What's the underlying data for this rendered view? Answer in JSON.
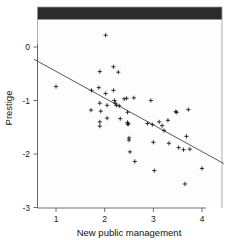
{
  "figure": {
    "kind": "scatterplot-with-regression-line",
    "background_color": "#ffffff",
    "top_band_color": "#2b2b2b"
  },
  "axes": {
    "x_title": "New public management",
    "y_title": "Prestige",
    "x_ticks": [
      "1",
      "2",
      "3",
      "4"
    ],
    "y_ticks": [
      "0",
      "-1",
      "-2",
      "-3"
    ]
  },
  "chart_data": {
    "type": "scatter",
    "title": "",
    "xlabel": "New public management",
    "ylabel": "Prestige",
    "xlim": [
      0.55,
      4.45
    ],
    "ylim": [
      -3.0,
      0.45
    ],
    "xticks": [
      1,
      2,
      3,
      4
    ],
    "yticks": [
      0,
      -1,
      -2,
      -3
    ],
    "grid": false,
    "legend": "none",
    "marker": "plus",
    "marker_color": "#141414",
    "series": [
      {
        "name": "observations",
        "points": [
          [
            1.0,
            -0.74
          ],
          [
            1.73,
            -0.81
          ],
          [
            1.72,
            -1.18
          ],
          [
            1.9,
            -0.46
          ],
          [
            1.88,
            -0.76
          ],
          [
            1.9,
            -1.05
          ],
          [
            1.92,
            -1.2
          ],
          [
            1.9,
            -1.4
          ],
          [
            1.9,
            -1.48
          ],
          [
            2.02,
            0.22
          ],
          [
            2.02,
            -0.87
          ],
          [
            2.05,
            -1.09
          ],
          [
            2.05,
            -1.33
          ],
          [
            2.18,
            -0.37
          ],
          [
            2.18,
            -0.81
          ],
          [
            2.2,
            -1.0
          ],
          [
            2.22,
            -1.05
          ],
          [
            2.24,
            -1.09
          ],
          [
            2.28,
            -0.47
          ],
          [
            2.3,
            -1.1
          ],
          [
            2.32,
            -1.34
          ],
          [
            2.4,
            -0.97
          ],
          [
            2.45,
            -0.96
          ],
          [
            2.47,
            -1.22
          ],
          [
            2.47,
            -1.41
          ],
          [
            2.47,
            -1.44
          ],
          [
            2.49,
            -1.44
          ],
          [
            2.5,
            -1.7
          ],
          [
            2.5,
            -1.74
          ],
          [
            2.52,
            -1.96
          ],
          [
            2.6,
            -0.95
          ],
          [
            2.62,
            -2.14
          ],
          [
            2.88,
            -1.43
          ],
          [
            2.95,
            -1.0
          ],
          [
            2.98,
            -1.45
          ],
          [
            3.0,
            -1.78
          ],
          [
            3.02,
            -2.31
          ],
          [
            3.12,
            -1.4
          ],
          [
            3.18,
            -1.47
          ],
          [
            3.22,
            -1.56
          ],
          [
            3.3,
            -1.37
          ],
          [
            3.32,
            -1.8
          ],
          [
            3.46,
            -1.21
          ],
          [
            3.48,
            -1.22
          ],
          [
            3.52,
            -1.88
          ],
          [
            3.62,
            -1.92
          ],
          [
            3.65,
            -2.56
          ],
          [
            3.68,
            -1.67
          ],
          [
            3.72,
            -1.17
          ],
          [
            3.75,
            -1.91
          ],
          [
            4.0,
            -2.27
          ]
        ]
      }
    ],
    "fit_line": {
      "name": "ols-regression-line",
      "x_start": 0.55,
      "y_start": -0.23,
      "x_end": 4.45,
      "y_end": -2.18
    }
  }
}
